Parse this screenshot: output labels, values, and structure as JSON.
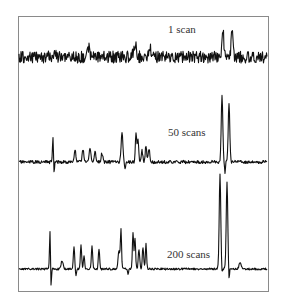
{
  "chart_data": {
    "type": "line",
    "title": "",
    "xlabel": "",
    "ylabel": "",
    "grid": false,
    "legend": "none",
    "frame": {
      "x0": 18,
      "y0": 16,
      "x1": 268,
      "y1": 291
    },
    "series": [
      {
        "name": "1 scan",
        "label": "1 scan",
        "label_pos": {
          "x": 168,
          "y": 24
        },
        "baseline_y": 57,
        "noise_amp": 6,
        "seed": 7,
        "peaks": [
          {
            "x": 55,
            "h": 7,
            "w": 1.5
          },
          {
            "x": 89,
            "h": 9,
            "w": 1.5
          },
          {
            "x": 135,
            "h": 12,
            "w": 2
          },
          {
            "x": 150,
            "h": 10,
            "w": 1.5
          },
          {
            "x": 223,
            "h": 27,
            "w": 1.2
          },
          {
            "x": 232,
            "h": 25,
            "w": 1.2
          }
        ],
        "dips": []
      },
      {
        "name": "50 scans",
        "label": "50 scans",
        "label_pos": {
          "x": 168,
          "y": 127
        },
        "baseline_y": 162,
        "noise_amp": 1.6,
        "seed": 11,
        "peaks": [
          {
            "x": 53,
            "h": 26,
            "w": 0.7
          },
          {
            "x": 75,
            "h": 12,
            "w": 1.2
          },
          {
            "x": 83,
            "h": 13,
            "w": 1.2
          },
          {
            "x": 90,
            "h": 14,
            "w": 1.2
          },
          {
            "x": 95,
            "h": 10,
            "w": 1.2
          },
          {
            "x": 102,
            "h": 9,
            "w": 1.2
          },
          {
            "x": 122,
            "h": 28,
            "w": 1.3
          },
          {
            "x": 136,
            "h": 28,
            "w": 1.0
          },
          {
            "x": 138,
            "h": 22,
            "w": 1.0
          },
          {
            "x": 142,
            "h": 12,
            "w": 1.0
          },
          {
            "x": 146,
            "h": 17,
            "w": 1.0
          },
          {
            "x": 149,
            "h": 14,
            "w": 1.0
          },
          {
            "x": 222,
            "h": 68,
            "w": 1.1
          },
          {
            "x": 229,
            "h": 58,
            "w": 1.1
          }
        ],
        "dips": [
          {
            "x": 54,
            "h": 14,
            "w": 0.6
          },
          {
            "x": 125,
            "h": 6,
            "w": 0.8
          },
          {
            "x": 225,
            "h": 12,
            "w": 0.6
          }
        ]
      },
      {
        "name": "200 scans",
        "label": "200 scans",
        "label_pos": {
          "x": 167,
          "y": 249
        },
        "baseline_y": 269,
        "noise_amp": 1.0,
        "seed": 23,
        "peaks": [
          {
            "x": 50,
            "h": 38,
            "w": 0.7
          },
          {
            "x": 62,
            "h": 8,
            "w": 1.5
          },
          {
            "x": 74,
            "h": 22,
            "w": 0.9
          },
          {
            "x": 81,
            "h": 24,
            "w": 0.9
          },
          {
            "x": 84,
            "h": 14,
            "w": 0.9
          },
          {
            "x": 92,
            "h": 23,
            "w": 0.9
          },
          {
            "x": 99,
            "h": 20,
            "w": 0.9
          },
          {
            "x": 119,
            "h": 18,
            "w": 1.3
          },
          {
            "x": 121,
            "h": 38,
            "w": 0.8
          },
          {
            "x": 133,
            "h": 36,
            "w": 0.9
          },
          {
            "x": 135,
            "h": 30,
            "w": 0.9
          },
          {
            "x": 139,
            "h": 20,
            "w": 1.0
          },
          {
            "x": 143,
            "h": 22,
            "w": 1.0
          },
          {
            "x": 146,
            "h": 26,
            "w": 0.8
          },
          {
            "x": 220,
            "h": 95,
            "w": 1.1
          },
          {
            "x": 227,
            "h": 87,
            "w": 1.1
          },
          {
            "x": 240,
            "h": 6,
            "w": 1.5
          }
        ],
        "dips": [
          {
            "x": 51,
            "h": 20,
            "w": 0.6
          },
          {
            "x": 76,
            "h": 6,
            "w": 0.7
          },
          {
            "x": 128,
            "h": 6,
            "w": 0.7
          },
          {
            "x": 222,
            "h": 6,
            "w": 0.6
          },
          {
            "x": 229,
            "h": 12,
            "w": 0.6
          }
        ]
      }
    ]
  }
}
